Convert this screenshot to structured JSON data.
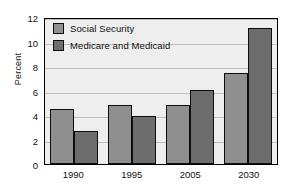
{
  "chart_data": {
    "type": "bar",
    "title": "",
    "xlabel": "",
    "ylabel": "Percent",
    "categories": [
      "1990",
      "1995",
      "2005",
      "2030"
    ],
    "series": [
      {
        "name": "Social Security",
        "values": [
          4.5,
          4.85,
          4.85,
          7.4
        ],
        "color": "#8f8f8f"
      },
      {
        "name": "Medicare and Medicaid",
        "values": [
          2.7,
          3.9,
          6.05,
          11.1
        ],
        "color": "#6d6d6d"
      }
    ],
    "ylim": [
      0,
      12
    ],
    "yticks": [
      0,
      2,
      4,
      6,
      8,
      10,
      12
    ],
    "ytick_labels": [
      "0",
      "2",
      "4",
      "6",
      "8",
      "10",
      "12"
    ],
    "grid": true,
    "legend_position": "top-left",
    "plot_background": "#eeeeee",
    "axis_color": "#000000",
    "gridline_color": "#bdbdbd"
  }
}
